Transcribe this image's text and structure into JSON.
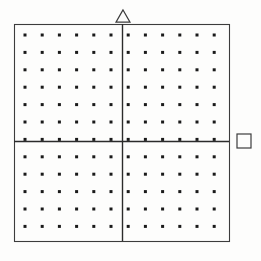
{
  "figure": {
    "canvas": {
      "width": 261,
      "height": 261,
      "background": "#fdfdfc"
    },
    "frame": {
      "name": "plot-frame",
      "x": 14,
      "y": 24,
      "width": 215,
      "height": 217,
      "stroke": "#3c3c3c",
      "stroke_width": 1.1
    },
    "axes": {
      "stroke": "#2b2b2b",
      "stroke_width": 1.4,
      "vertical": {
        "name": "vertical-axis",
        "x": 122,
        "y1": 24,
        "y2": 241
      },
      "horizontal": {
        "name": "horizontal-axis",
        "y": 141,
        "x1": 14,
        "x2": 229
      },
      "origin": {
        "x": 122,
        "y": 141
      }
    },
    "grid": {
      "name": "dot-grid",
      "columns": 12,
      "rows": 12,
      "dot_size": 3,
      "dot_color": "#1a1a1a",
      "first_dot_x": 25,
      "first_dot_y": 35,
      "spacing_x": 17.2,
      "spacing_y": 17.4,
      "columns_left_of_axis": 6,
      "columns_right_of_axis": 6,
      "rows_above_axis": 6,
      "rows_below_axis": 6
    },
    "markers": [
      {
        "name": "triangle-marker-top",
        "shape": "triangle",
        "filled": false,
        "center_x": 123,
        "center_y": 16,
        "size": 14,
        "stroke": "#3c3c3c",
        "position_label": "above-top-edge-on-vertical-axis"
      },
      {
        "name": "square-marker-right",
        "shape": "square",
        "filled": false,
        "center_x": 244,
        "center_y": 141,
        "size": 14,
        "stroke": "#3c3c3c",
        "position_label": "right-of-right-edge-on-horizontal-axis"
      }
    ]
  }
}
